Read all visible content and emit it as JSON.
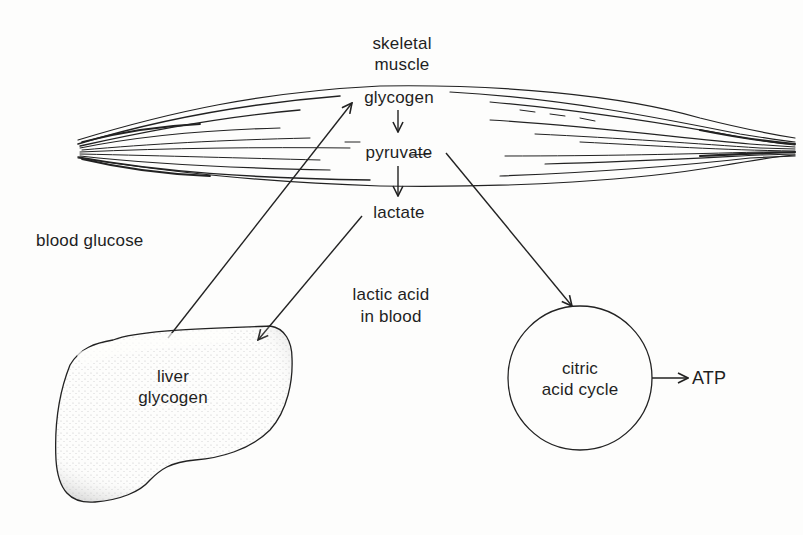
{
  "diagram": {
    "type": "metabolic-pathway",
    "labels": {
      "skeletal_muscle_line1": "skeletal",
      "skeletal_muscle_line2": "muscle",
      "muscle_glycogen": "glycogen",
      "pyruvate": "pyruvate",
      "lactate": "lactate",
      "blood_glucose": "blood glucose",
      "lactic_acid_line1": "lactic acid",
      "lactic_acid_line2": "in blood",
      "liver_line1": "liver",
      "liver_line2": "glycogen",
      "citric_line1": "citric",
      "citric_line2": "acid cycle",
      "atp": "ATP"
    },
    "nodes": [
      {
        "id": "skeletal-muscle",
        "label": "skeletal muscle",
        "shape": "fibrous spindle"
      },
      {
        "id": "muscle-glycogen",
        "label": "glycogen"
      },
      {
        "id": "pyruvate",
        "label": "pyruvate"
      },
      {
        "id": "lactate",
        "label": "lactate"
      },
      {
        "id": "liver-glycogen",
        "label": "liver glycogen",
        "shape": "stippled liver outline"
      },
      {
        "id": "citric-acid-cycle",
        "label": "citric acid cycle",
        "shape": "circle"
      },
      {
        "id": "atp",
        "label": "ATP"
      }
    ],
    "edges": [
      {
        "from": "muscle-glycogen",
        "to": "pyruvate"
      },
      {
        "from": "pyruvate",
        "to": "lactate"
      },
      {
        "from": "lactate",
        "to": "liver-glycogen",
        "via": "lactic acid in blood"
      },
      {
        "from": "liver-glycogen",
        "to": "muscle-glycogen",
        "via": "blood glucose"
      },
      {
        "from": "pyruvate",
        "to": "citric-acid-cycle"
      },
      {
        "from": "citric-acid-cycle",
        "to": "atp"
      }
    ],
    "colors": {
      "ink": "#1f1f1f",
      "background": "#fdfdfc"
    }
  }
}
